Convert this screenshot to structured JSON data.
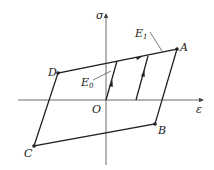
{
  "diagram": {
    "axes": {
      "y_label": "σ",
      "x_label": "ε"
    },
    "points": {
      "A": "A",
      "B": "B",
      "C": "C",
      "D": "D",
      "O": "O"
    },
    "moduli": {
      "E0_main": "E",
      "E0_sub": "0",
      "E1_main": "E",
      "E1_sub": "1"
    },
    "colors": {
      "line": "#222222",
      "axis": "#444444"
    }
  }
}
